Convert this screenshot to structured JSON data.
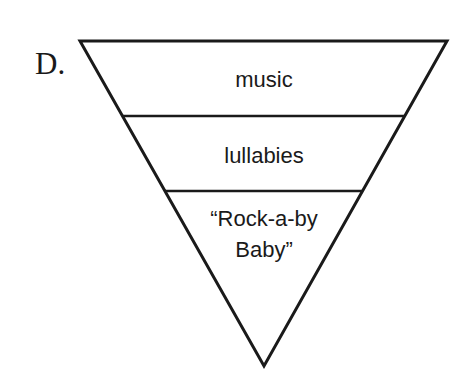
{
  "label": "D.",
  "diagram": {
    "type": "inverted-triangle-hierarchy",
    "levels": [
      {
        "text": "music"
      },
      {
        "text": "lullabies"
      },
      {
        "text_line1": "“Rock-a-by",
        "text_line2": "Baby”"
      }
    ],
    "stroke_color": "#1a1a1a"
  }
}
